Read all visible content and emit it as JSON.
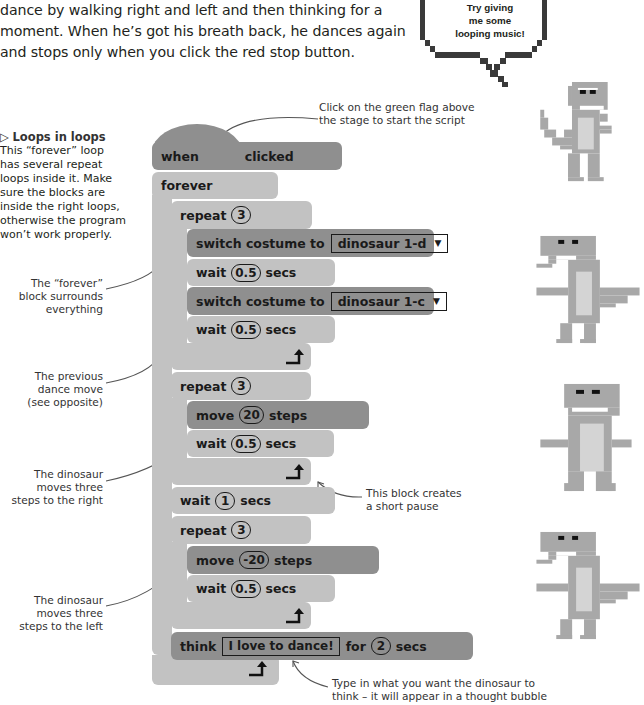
{
  "intro": {
    "lines": [
      "dance by walking right and left and then thinking for a",
      "moment. When he’s got his breath back, he dances again",
      "and stops only when you click the red stop button."
    ]
  },
  "speech_bubble": {
    "lines": [
      "Try giving",
      "me some",
      "looping music!"
    ]
  },
  "sidebar": {
    "title_icon": "triangle-right-icon",
    "title": "Loops in loops",
    "body_lines": [
      "This “forever” loop",
      "has several repeat",
      "loops inside it. Make",
      "sure the blocks are",
      "inside the right loops,",
      "otherwise the program",
      "won’t work properly."
    ]
  },
  "annotations": {
    "green_flag": [
      "Click on the green flag above",
      "the stage to start the script"
    ],
    "forever_block": [
      "The “forever”",
      "block surrounds",
      "everything"
    ],
    "previous_move": [
      "The previous",
      "dance move",
      "(see opposite)"
    ],
    "moves_right": [
      "The dinosaur",
      "moves three",
      "steps to the right"
    ],
    "short_pause": [
      "This block creates",
      "a short pause"
    ],
    "moves_left": [
      "The dinosaur",
      "moves three",
      "steps to the left"
    ],
    "think": [
      "Type in what you want the dinosaur to",
      "think – it will appear in a thought bubble"
    ]
  },
  "script": {
    "hat": {
      "when": "when",
      "clicked": "clicked"
    },
    "forever": "forever",
    "repeat1": {
      "label": "repeat",
      "count": "3"
    },
    "switch1": {
      "label": "switch costume to",
      "costume": "dinosaur 1-d",
      "arrow": "▼"
    },
    "wait1": {
      "label": "wait",
      "value": "0.5",
      "unit": "secs"
    },
    "switch2": {
      "label": "switch costume to",
      "costume": "dinosaur 1-c",
      "arrow": "▼"
    },
    "wait2": {
      "label": "wait",
      "value": "0.5",
      "unit": "secs"
    },
    "repeat2": {
      "label": "repeat",
      "count": "3"
    },
    "move1": {
      "label": "move",
      "value": "20",
      "unit": "steps"
    },
    "wait3": {
      "label": "wait",
      "value": "0.5",
      "unit": "secs"
    },
    "wait4": {
      "label": "wait",
      "value": "1",
      "unit": "secs"
    },
    "repeat3": {
      "label": "repeat",
      "count": "3"
    },
    "move2": {
      "label": "move",
      "value": "-20",
      "unit": "steps"
    },
    "wait5": {
      "label": "wait",
      "value": "0.5",
      "unit": "secs"
    },
    "think": {
      "label": "think",
      "text": "I love to dance!",
      "for": "for",
      "value": "2",
      "unit": "secs"
    }
  },
  "colors": {
    "motion_block": "#8f8f8f",
    "control_block": "#c2c2c2",
    "text": "#231f20",
    "dino_body": "#a8a8a8",
    "dino_belly": "#d4d4d4",
    "bubble_outline": "#3a3a3a"
  }
}
